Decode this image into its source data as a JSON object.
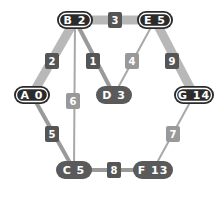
{
  "graph": {
    "type": "weighted-undirected-graph",
    "colors": {
      "visited_node_fill": "#2b2b2b",
      "visited_node_ring": "#ffffff",
      "unvisited_node_fill": "#5a5a5a",
      "edge_thick": "#b8b8b8",
      "edge_medium": "#9a9a9a",
      "edge_thin": "#a8a8a8",
      "label_dark": "#555555",
      "label_light": "#999999"
    },
    "nodes": [
      {
        "id": "B",
        "label": "B 2",
        "x": 75,
        "y": 20,
        "state": "visited"
      },
      {
        "id": "E",
        "label": "E 5",
        "x": 155,
        "y": 20,
        "state": "visited"
      },
      {
        "id": "A",
        "label": "A 0",
        "x": 32,
        "y": 95,
        "state": "visited"
      },
      {
        "id": "D",
        "label": "D 3",
        "x": 114,
        "y": 95,
        "state": "unvisited"
      },
      {
        "id": "G",
        "label": "G 14",
        "x": 194,
        "y": 95,
        "state": "visited"
      },
      {
        "id": "C",
        "label": "C 5",
        "x": 74,
        "y": 170,
        "state": "unvisited"
      },
      {
        "id": "F",
        "label": "F 13",
        "x": 153,
        "y": 170,
        "state": "unvisited"
      }
    ],
    "edges": [
      {
        "from": "B",
        "to": "E",
        "weight": "3",
        "style": "thick",
        "label_x": 115,
        "label_y": 20,
        "label_tone": "dark"
      },
      {
        "from": "B",
        "to": "A",
        "weight": "2",
        "style": "thick",
        "label_x": 52,
        "label_y": 61,
        "label_tone": "dark"
      },
      {
        "from": "B",
        "to": "D",
        "weight": "1",
        "style": "medium",
        "label_x": 93,
        "label_y": 61,
        "label_tone": "dark"
      },
      {
        "from": "B",
        "to": "C",
        "weight": "6",
        "style": "thin",
        "label_x": 73,
        "label_y": 101,
        "label_tone": "light"
      },
      {
        "from": "E",
        "to": "D",
        "weight": "4",
        "style": "thin",
        "label_x": 132,
        "label_y": 61,
        "label_tone": "light"
      },
      {
        "from": "E",
        "to": "G",
        "weight": "9",
        "style": "thick",
        "label_x": 172,
        "label_y": 61,
        "label_tone": "dark"
      },
      {
        "from": "A",
        "to": "C",
        "weight": "5",
        "style": "medium",
        "label_x": 52,
        "label_y": 134,
        "label_tone": "dark"
      },
      {
        "from": "C",
        "to": "F",
        "weight": "8",
        "style": "medium",
        "label_x": 114,
        "label_y": 170,
        "label_tone": "dark"
      },
      {
        "from": "G",
        "to": "F",
        "weight": "7",
        "style": "thin",
        "label_x": 173,
        "label_y": 134,
        "label_tone": "light"
      }
    ]
  }
}
